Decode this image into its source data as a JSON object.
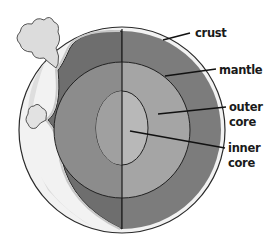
{
  "diagram": {
    "labels": {
      "crust": "crust",
      "mantle": "mantle",
      "outer_core_line1": "outer",
      "outer_core_line2": "core",
      "inner_core_line1": "inner",
      "inner_core_line2": "core"
    },
    "colors": {
      "background": "#ffffff",
      "crust": "#e8e8e8",
      "mantle_left": "#6e6e6e",
      "mantle_right": "#7c7c7c",
      "outer_core": "#a5a5a5",
      "inner_core": "#b8b8b8",
      "outline": "#2a2a2a",
      "smoke": "#dcdcdc"
    }
  }
}
